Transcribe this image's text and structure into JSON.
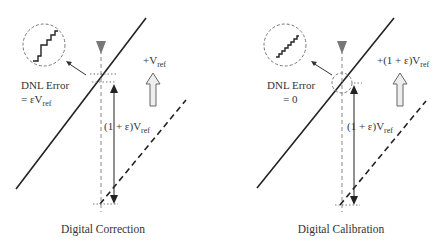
{
  "panels": [
    {
      "id": "correction",
      "caption": "Digital Correction",
      "dnl_line1": "DNL Error",
      "dnl_line2_prefix": "= εV",
      "dnl_line2_sub": "ref",
      "step_label_main": "(1 + ε)V",
      "step_label_sub": "ref",
      "shift_label_main": "+V",
      "shift_label_sub": "ref",
      "staircase_type": "irregular"
    },
    {
      "id": "calibration",
      "caption": "Digital Calibration",
      "dnl_line1": "DNL Error",
      "dnl_line2_prefix": "= 0",
      "dnl_line2_sub": "",
      "step_label_main": "(1 + ε)V",
      "step_label_sub": "ref",
      "shift_label_main": "+(1 + ε)V",
      "shift_label_sub": "ref",
      "staircase_type": "uniform"
    }
  ],
  "colors": {
    "line": "#222222",
    "dashed_guide": "#888888",
    "marker": "#777777",
    "arrow_fill": "#eeeeee",
    "arrow_stroke": "#666666"
  }
}
